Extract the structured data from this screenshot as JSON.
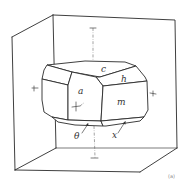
{
  "diagram": {
    "type": "crystal-morphology",
    "faces": [
      {
        "id": "c",
        "label": "c"
      },
      {
        "id": "h",
        "label": "h"
      },
      {
        "id": "a",
        "label": "a"
      },
      {
        "id": "m",
        "label": "m"
      },
      {
        "id": "theta",
        "label": "θ"
      },
      {
        "id": "x",
        "label": "x"
      }
    ],
    "corner_mark": "(a)",
    "colors": {
      "line": "#2a2a2a",
      "axis": "#666666",
      "background": "#ffffff"
    }
  }
}
